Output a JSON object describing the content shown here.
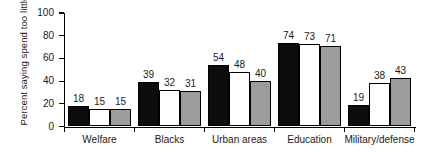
{
  "chart_data": {
    "type": "bar",
    "title": "",
    "subtitle": "",
    "xlabel": "",
    "ylabel": "Percent saying spend too little",
    "ylim": [
      0,
      100
    ],
    "yticks": [
      0,
      20,
      40,
      60,
      80,
      100
    ],
    "ytick_labels": [
      "0",
      "20",
      "40",
      "60",
      "80",
      "100"
    ],
    "grid": false,
    "legend": "none",
    "categories": [
      "Welfare",
      "Blacks",
      "Urban areas",
      "Education",
      "Military/defense"
    ],
    "series": [
      {
        "name": "series-1",
        "color": "#0d0d0d",
        "style": "black",
        "values": [
          18,
          39,
          54,
          74,
          19
        ]
      },
      {
        "name": "series-2",
        "color": "#ffffff",
        "style": "white",
        "values": [
          15,
          32,
          48,
          73,
          38
        ]
      },
      {
        "name": "series-3",
        "color": "#9c9c9c",
        "style": "gray",
        "values": [
          15,
          31,
          40,
          71,
          43
        ]
      }
    ],
    "bar_labels": [
      [
        "18",
        "15",
        "15"
      ],
      [
        "39",
        "32",
        "31"
      ],
      [
        "54",
        "48",
        "40"
      ],
      [
        "74",
        "73",
        "71"
      ],
      [
        "19",
        "38",
        "43"
      ]
    ]
  },
  "axes": {
    "y_title": "Percent saying spend too little"
  },
  "colors": {
    "axis": "#000000",
    "text": "#1a1a1a",
    "bar_black": "#0d0d0d",
    "bar_white": "#ffffff",
    "bar_gray": "#9c9c9c",
    "background": "#ffffff"
  }
}
